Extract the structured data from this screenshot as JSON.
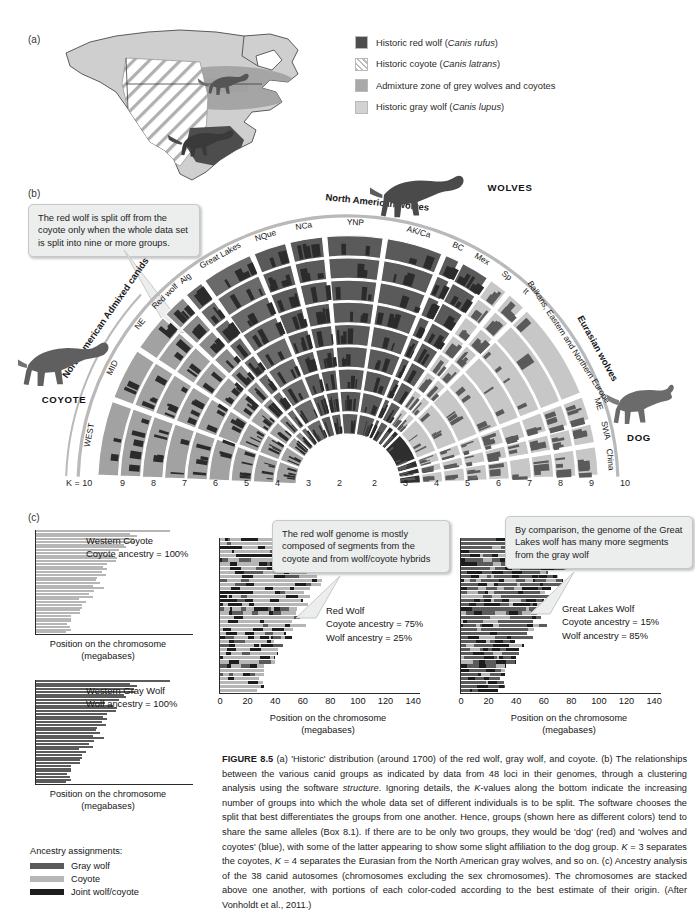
{
  "figure": {
    "number": "FIGURE 8.5",
    "caption_parts": [
      {
        "style": "bold",
        "text": "FIGURE 8.5"
      },
      {
        "style": "normal",
        "text": "   (a) 'Historic' distribution (around 1700) of the red wolf, gray wolf, and coyote. (b) The relationships between the various canid groups as indicated by data from 48 loci in their genomes, through a clustering analysis using the software "
      },
      {
        "style": "italic",
        "text": "structure"
      },
      {
        "style": "normal",
        "text": ". Ignoring details, the "
      },
      {
        "style": "italic",
        "text": "K"
      },
      {
        "style": "normal",
        "text": "-values along the bottom indicate the increasing number of groups into which the whole data set of different individuals is to be split. The software chooses the split that best differentiates the groups from one another. Hence, groups (shown here as different colors) tend to share the same alleles (Box 8.1). If there are to be only two groups, they would be 'dog' (red) and 'wolves and coyotes' (blue), with some of the latter appearing to show some slight affiliation to the dog group. "
      },
      {
        "style": "italic",
        "text": "K"
      },
      {
        "style": "normal",
        "text": " = 3 separates the coyotes, "
      },
      {
        "style": "italic",
        "text": "K"
      },
      {
        "style": "normal",
        "text": " = 4 separates the Eurasian from the North American gray wolves, and so on. (c) Ancestry analysis of the 38 canid autosomes (chromosomes excluding the sex chromosomes). The chromosomes are stacked above one another, with portions of each color-coded according to the best estimate of their origin. (After Vonholdt et al., 2011.)"
      }
    ]
  },
  "panel_a": {
    "letter": "(a)",
    "legend": [
      {
        "label_plain": "Historic red wolf (",
        "italic": "Canis rufus",
        "tail": ")",
        "swatch": "#4d4d4d",
        "pattern": "solid",
        "name": "historic-red-wolf"
      },
      {
        "label_plain": "Historic coyote (",
        "italic": "Canis latrans",
        "tail": ")",
        "swatch": "#ffffff",
        "pattern": "hatch",
        "name": "historic-coyote"
      },
      {
        "label_plain": "Admixture zone of grey wolves and coyotes",
        "italic": "",
        "tail": "",
        "swatch": "#a9a9a9",
        "pattern": "solid",
        "name": "admixture-zone"
      },
      {
        "label_plain": "Historic gray wolf (",
        "italic": "Canis lupus",
        "tail": ")",
        "swatch": "#cfcfcf",
        "pattern": "solid",
        "name": "historic-gray-wolf"
      }
    ]
  },
  "panel_b": {
    "letter": "(b)",
    "callout": "The red wolf is split off from the coyote only when the whole data set is split into nine or more groups.",
    "animals": {
      "coyote": "COYOTE",
      "wolves": "WOLVES",
      "dog": "DOG"
    },
    "group_headers": [
      {
        "text": "North American Admixed canids",
        "name": "group-header-na-admixed"
      },
      {
        "text": "North American wolves",
        "name": "group-header-na-wolves"
      },
      {
        "text": "Eurasian wolves",
        "name": "group-header-eurasian-wolves"
      }
    ],
    "sector_labels": [
      {
        "text": "WEST",
        "name": "sector-west"
      },
      {
        "text": "MID",
        "name": "sector-mid"
      },
      {
        "text": "NE",
        "name": "sector-ne"
      },
      {
        "text": "Red wolf",
        "name": "sector-red-wolf"
      },
      {
        "text": "Alg",
        "name": "sector-alg"
      },
      {
        "text": "Great Lakes",
        "name": "sector-great-lakes"
      },
      {
        "text": "NQue",
        "name": "sector-nque"
      },
      {
        "text": "NCa",
        "name": "sector-nca"
      },
      {
        "text": "YNP",
        "name": "sector-ynp"
      },
      {
        "text": "AK/Ca",
        "name": "sector-ak-ca"
      },
      {
        "text": "BC",
        "name": "sector-bc"
      },
      {
        "text": "Mex",
        "name": "sector-mex"
      },
      {
        "text": "Sp",
        "name": "sector-sp"
      },
      {
        "text": "It",
        "name": "sector-it"
      },
      {
        "text": "Balkans, Eastern and Northern Europe",
        "name": "sector-balkans"
      },
      {
        "text": "ME",
        "name": "sector-me"
      },
      {
        "text": "SWA",
        "name": "sector-swa"
      },
      {
        "text": "China",
        "name": "sector-china"
      }
    ],
    "k_axis_prefix": "K = 10",
    "k_axis_left": [
      "9",
      "8",
      "7",
      "6",
      "5",
      "4",
      "3",
      "2"
    ],
    "k_axis_right": [
      "2",
      "3",
      "4",
      "5",
      "6",
      "7",
      "8",
      "9",
      "10"
    ]
  },
  "panel_c": {
    "letter": "(c)",
    "axis_caption_line1": "Position on the chromosome",
    "axis_caption_line2": "(megabases)",
    "callouts": [
      {
        "name": "callout-red-wolf",
        "text": "The red wolf genome is mostly composed of segments from  the coyote and from wolf/coyote hybrids"
      },
      {
        "name": "callout-great-lakes",
        "text": "By comparison, the genome of the Great Lakes wolf has many more segments from the gray wolf"
      }
    ],
    "legend": {
      "title": "Ancestry assignments:",
      "items": [
        {
          "label": "Gray wolf",
          "color": "#5b5b5b",
          "name": "legend-gray-wolf"
        },
        {
          "label": "Coyote",
          "color": "#b6b6b6",
          "name": "legend-coyote"
        },
        {
          "label": "Joint wolf/coyote",
          "color": "#1d1d1d",
          "name": "legend-joint"
        }
      ]
    },
    "tick_labels": [
      "0",
      "20",
      "40",
      "60",
      "80",
      "100",
      "120",
      "140"
    ]
  },
  "chart_data": [
    {
      "type": "bar",
      "name": "western-coyote",
      "title_lines": [
        "Western Coyote",
        "Coyote ancestry = 100%"
      ],
      "coyote_ancestry_pct": 100,
      "wolf_ancestry_pct": 0,
      "xlabel": "Position on the chromosome (megabases)",
      "xlim": [
        0,
        145
      ],
      "axis_shown": false,
      "categories": [
        "chr1",
        "chr2",
        "chr3",
        "chr4",
        "chr5",
        "chr6",
        "chr7",
        "chr8",
        "chr9",
        "chr10",
        "chr11",
        "chr12",
        "chr13",
        "chr14",
        "chr15",
        "chr16",
        "chr17",
        "chr18",
        "chr19",
        "chr20",
        "chr21",
        "chr22",
        "chr23",
        "chr24",
        "chr25",
        "chr26",
        "chr27",
        "chr28",
        "chr29",
        "chr30",
        "chr31",
        "chr32",
        "chr33",
        "chr34",
        "chr35",
        "chr36",
        "chr37",
        "chr38"
      ],
      "values": [
        122,
        86,
        92,
        89,
        90,
        80,
        82,
        76,
        63,
        70,
        74,
        73,
        65,
        61,
        65,
        60,
        64,
        56,
        55,
        58,
        52,
        62,
        53,
        48,
        52,
        39,
        46,
        42,
        42,
        40,
        40,
        32,
        32,
        32,
        28,
        31,
        32,
        27
      ],
      "segments_note": "all segments coyote"
    },
    {
      "type": "bar",
      "name": "western-gray-wolf",
      "title_lines": [
        "Western Gray Wolf",
        "Wolf ancestry = 100%"
      ],
      "coyote_ancestry_pct": 0,
      "wolf_ancestry_pct": 100,
      "xlabel": "Position on the chromosome (megabases)",
      "xlim": [
        0,
        145
      ],
      "axis_shown": false,
      "categories": [
        "chr1",
        "chr2",
        "chr3",
        "chr4",
        "chr5",
        "chr6",
        "chr7",
        "chr8",
        "chr9",
        "chr10",
        "chr11",
        "chr12",
        "chr13",
        "chr14",
        "chr15",
        "chr16",
        "chr17",
        "chr18",
        "chr19",
        "chr20",
        "chr21",
        "chr22",
        "chr23",
        "chr24",
        "chr25",
        "chr26",
        "chr27",
        "chr28",
        "chr29",
        "chr30",
        "chr31",
        "chr32",
        "chr33",
        "chr34",
        "chr35",
        "chr36",
        "chr37",
        "chr38"
      ],
      "values": [
        122,
        86,
        92,
        89,
        90,
        80,
        82,
        76,
        63,
        70,
        74,
        73,
        65,
        61,
        65,
        60,
        64,
        56,
        55,
        58,
        52,
        62,
        53,
        48,
        52,
        39,
        46,
        42,
        42,
        40,
        40,
        32,
        32,
        32,
        28,
        31,
        32,
        27
      ],
      "segments_note": "all segments gray wolf"
    },
    {
      "type": "bar",
      "name": "red-wolf",
      "title_lines": [
        "Red Wolf",
        "Coyote ancestry = 75%",
        "Wolf ancestry = 25%"
      ],
      "coyote_ancestry_pct": 75,
      "wolf_ancestry_pct": 25,
      "xlabel": "Position on the chromosome (megabases)",
      "xlim": [
        0,
        145
      ],
      "xticks": [
        0,
        20,
        40,
        60,
        80,
        100,
        120,
        140
      ],
      "axis_shown": true,
      "categories": [
        "chr1",
        "chr2",
        "chr3",
        "chr4",
        "chr5",
        "chr6",
        "chr7",
        "chr8",
        "chr9",
        "chr10",
        "chr11",
        "chr12",
        "chr13",
        "chr14",
        "chr15",
        "chr16",
        "chr17",
        "chr18",
        "chr19",
        "chr20",
        "chr21",
        "chr22",
        "chr23",
        "chr24",
        "chr25",
        "chr26",
        "chr27",
        "chr28",
        "chr29",
        "chr30",
        "chr31",
        "chr32",
        "chr33",
        "chr34",
        "chr35",
        "chr36",
        "chr37",
        "chr38"
      ],
      "values": [
        122,
        86,
        92,
        89,
        90,
        80,
        82,
        76,
        63,
        70,
        74,
        73,
        65,
        61,
        65,
        60,
        64,
        56,
        55,
        58,
        52,
        62,
        53,
        48,
        52,
        39,
        46,
        42,
        42,
        40,
        40,
        32,
        32,
        32,
        28,
        31,
        32,
        27
      ]
    },
    {
      "type": "bar",
      "name": "great-lakes-wolf",
      "title_lines": [
        "Great Lakes Wolf",
        "Coyote ancestry = 15%",
        "Wolf ancestry = 85%"
      ],
      "coyote_ancestry_pct": 15,
      "wolf_ancestry_pct": 85,
      "xlabel": "Position on the chromosome (megabases)",
      "xlim": [
        0,
        145
      ],
      "xticks": [
        0,
        20,
        40,
        60,
        80,
        100,
        120,
        140
      ],
      "axis_shown": true,
      "categories": [
        "chr1",
        "chr2",
        "chr3",
        "chr4",
        "chr5",
        "chr6",
        "chr7",
        "chr8",
        "chr9",
        "chr10",
        "chr11",
        "chr12",
        "chr13",
        "chr14",
        "chr15",
        "chr16",
        "chr17",
        "chr18",
        "chr19",
        "chr20",
        "chr21",
        "chr22",
        "chr23",
        "chr24",
        "chr25",
        "chr26",
        "chr27",
        "chr28",
        "chr29",
        "chr30",
        "chr31",
        "chr32",
        "chr33",
        "chr34",
        "chr35",
        "chr36",
        "chr37",
        "chr38"
      ],
      "values": [
        122,
        86,
        92,
        89,
        90,
        80,
        82,
        76,
        63,
        70,
        74,
        73,
        65,
        61,
        65,
        60,
        64,
        56,
        55,
        58,
        52,
        62,
        53,
        48,
        52,
        39,
        46,
        42,
        42,
        40,
        40,
        32,
        32,
        32,
        28,
        31,
        32,
        27
      ]
    }
  ],
  "colors": {
    "coyote": "#b6b6b6",
    "gray_wolf": "#5b5b5b",
    "joint": "#1d1d1d",
    "fan_coyote": "#9d9d9d",
    "fan_wolf": "#575757",
    "fan_dog": "#2a2a2a",
    "fan_light": "#c9c9c9"
  }
}
